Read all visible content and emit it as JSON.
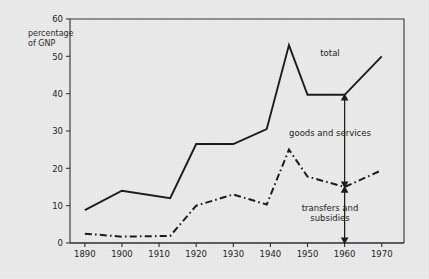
{
  "chart_data": {
    "type": "line",
    "title": "",
    "subtitle": "",
    "xlabel": "",
    "ylabel": "percentage of GNP",
    "ylabel_line1": "percentage",
    "ylabel_line2": "of GNP",
    "xlim": [
      1886,
      1976
    ],
    "ylim": [
      0,
      60
    ],
    "grid": false,
    "legend_position": "inline-annotations",
    "yticks": [
      0,
      10,
      20,
      30,
      40,
      50,
      60
    ],
    "ytick_labels": [
      "0",
      "10",
      "20",
      "30",
      "40",
      "50",
      "60"
    ],
    "xticks": [
      1890,
      1900,
      1910,
      1920,
      1930,
      1940,
      1950,
      1960,
      1970
    ],
    "xtick_labels": [
      "1890",
      "1900",
      "1910",
      "1920",
      "1930",
      "1940",
      "1950",
      "1960",
      "1970"
    ],
    "series": [
      {
        "name": "total",
        "style": "solid",
        "color": "#1c1c1c",
        "x": [
          1890,
          1900,
          1913,
          1920,
          1930,
          1939,
          1945,
          1950,
          1960,
          1970
        ],
        "values": [
          8.8,
          14.0,
          12.0,
          26.5,
          26.5,
          30.5,
          53.0,
          39.7,
          39.7,
          50.0
        ]
      },
      {
        "name": "transfers and subsidies",
        "style": "dash-dot",
        "color": "#1c1c1c",
        "x": [
          1890,
          1900,
          1913,
          1920,
          1930,
          1939,
          1945,
          1950,
          1960,
          1970
        ],
        "values": [
          2.5,
          1.7,
          1.9,
          10.0,
          13.0,
          10.3,
          25.0,
          17.8,
          15.0,
          19.5
        ]
      }
    ],
    "annotations": [
      {
        "name": "total",
        "label": "total",
        "x": 1963,
        "y": 55.5,
        "kind": "series-label"
      },
      {
        "name": "goods and services",
        "label": "goods and services",
        "x": 1960,
        "y_top": 39.7,
        "y_bottom": 15.0,
        "kind": "double-arrow"
      },
      {
        "name": "transfers and subsidies",
        "label_line1": "transfers and",
        "label_line2": "subsidies",
        "label": "transfers and subsidies",
        "x": 1960,
        "y_top": 15.0,
        "y_bottom": 0.0,
        "kind": "double-arrow"
      }
    ]
  },
  "colors": {
    "background": "#e9e9e9",
    "ink": "#1c1c1c",
    "frame": "#333333"
  }
}
